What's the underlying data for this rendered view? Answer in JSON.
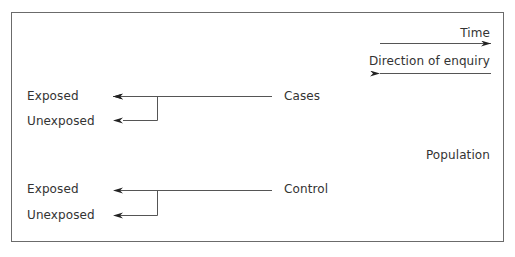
{
  "diagram": {
    "legend": {
      "time_label": "Time",
      "enquiry_label": "Direction of enquiry"
    },
    "population_label": "Population",
    "groups": [
      {
        "name": "Cases",
        "branches": [
          "Exposed",
          "Unexposed"
        ]
      },
      {
        "name": "Control",
        "branches": [
          "Exposed",
          "Unexposed"
        ]
      }
    ],
    "colors": {
      "line": "#555555",
      "arrowhead": "#222222",
      "border": "#6b6b6b",
      "text": "#333333"
    }
  }
}
